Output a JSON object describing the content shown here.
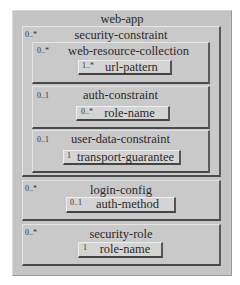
{
  "diagram": {
    "root": {
      "title": "web-app"
    },
    "security_constraint": {
      "title": "security-constraint",
      "multiplicity": "0..*",
      "web_resource_collection": {
        "title": "web-resource-collection",
        "multiplicity": "0..*",
        "url_pattern": {
          "label": "url-pattern",
          "multiplicity": "1..*"
        }
      },
      "auth_constraint": {
        "title": "auth-constraint",
        "multiplicity": "0..1",
        "role_name": {
          "label": "role-name",
          "multiplicity": "0..*"
        }
      },
      "user_data_constraint": {
        "title": "user-data-constraint",
        "multiplicity": "0..1",
        "transport_guarantee": {
          "label": "transport-guarantee",
          "multiplicity": "1"
        }
      }
    },
    "login_config": {
      "title": "login-config",
      "multiplicity": "0..*",
      "auth_method": {
        "label": "auth-method",
        "multiplicity": "0..1"
      }
    },
    "security_role": {
      "title": "security-role",
      "multiplicity": "0..*",
      "role_name": {
        "label": "role-name",
        "multiplicity": "1"
      }
    }
  }
}
